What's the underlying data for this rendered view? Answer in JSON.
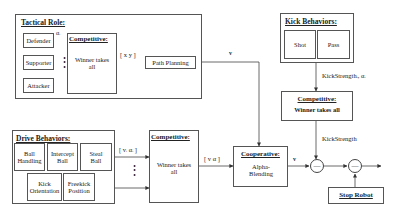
{
  "tactical": {
    "title": "Tactical Role:",
    "roles": [
      "Defender",
      "Supporter",
      "Attacker"
    ],
    "alpha_label": "αᵢ",
    "dots": "⋮",
    "competitive_title": "Competitive:",
    "competitive_body": "Winner takes all",
    "output_label": "[ x  y ]",
    "path_planning": "Path Planning",
    "v_label": "v"
  },
  "kick": {
    "title": "Kick Behaviors:",
    "behaviors": [
      "Shot",
      "Pass"
    ],
    "edge_label": "KickStrengthᵢ, αᵢ",
    "competitive_title": "Competitive:",
    "competitive_body": "Winner takes all",
    "output_label": "KickStrength"
  },
  "drive": {
    "title": "Drive Behaviors:",
    "behaviors": [
      "Ball Handling",
      "Intercept Ball",
      "Steal Ball",
      "Kick Orientation",
      "Freekick Position"
    ],
    "edge_label": "[ vᵢ  αᵢ ]",
    "dots": "⋮",
    "competitive_title": "Competitive:",
    "competitive_body": "Winner takes all",
    "output_label": "[ v  α ]"
  },
  "cooperative": {
    "title": "Cooperative:",
    "body": "Alpha-Blending",
    "v_label": "v"
  },
  "summing_nodes": [
    "—",
    "—"
  ],
  "stop_robot": "Stop Robot"
}
